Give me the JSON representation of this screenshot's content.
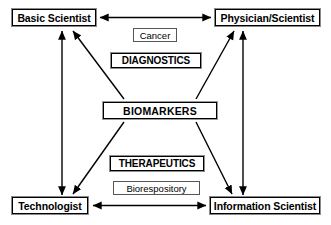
{
  "diagram": {
    "background_color": "#ffffff",
    "line_color": "#000000",
    "nodes": {
      "basic_scientist": "Basic Scientist",
      "physician_scientist": "Physician/Scientist",
      "technologist": "Technologist",
      "information_scientist": "Information Scientist",
      "biomarkers": "BIOMARKERS",
      "cancer": "Cancer",
      "diagnostics": "DIAGNOSTICS",
      "therapeutics": "THERAPEUTICS",
      "biorespository": "Biorespository"
    },
    "connections": [
      {
        "from": "basic_scientist",
        "to": "physician_scientist",
        "style": "double-headed",
        "orientation": "horizontal-top"
      },
      {
        "from": "technologist",
        "to": "information_scientist",
        "style": "double-headed",
        "orientation": "horizontal-bottom"
      },
      {
        "from": "basic_scientist",
        "to": "technologist",
        "style": "double-headed",
        "orientation": "vertical-left"
      },
      {
        "from": "physician_scientist",
        "to": "information_scientist",
        "style": "double-headed",
        "orientation": "vertical-right"
      },
      {
        "from": "biomarkers",
        "to": "basic_scientist",
        "style": "single-headed",
        "orientation": "diagonal-up-left"
      },
      {
        "from": "biomarkers",
        "to": "physician_scientist",
        "style": "single-headed",
        "orientation": "diagonal-up-right"
      },
      {
        "from": "biomarkers",
        "to": "technologist",
        "style": "single-headed",
        "orientation": "diagonal-down-left"
      },
      {
        "from": "biomarkers",
        "to": "information_scientist",
        "style": "single-headed",
        "orientation": "diagonal-down-right"
      }
    ]
  }
}
